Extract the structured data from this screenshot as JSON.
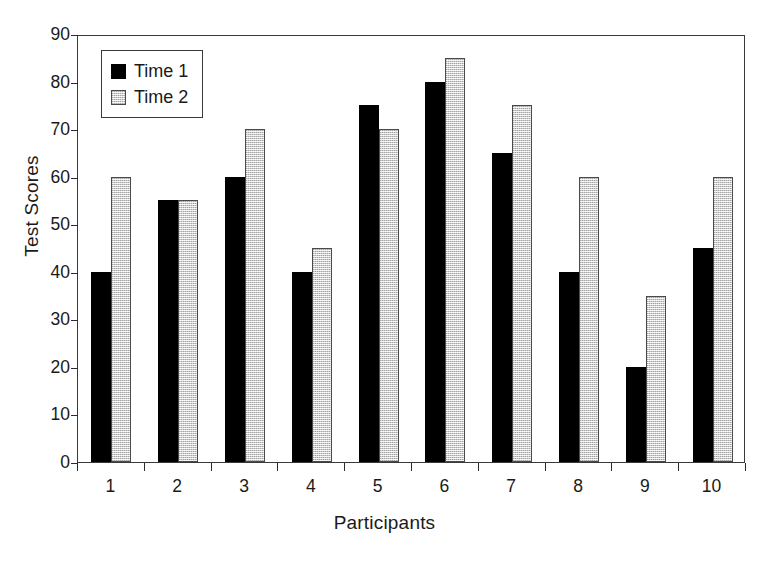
{
  "chart_data": {
    "type": "bar",
    "title": "",
    "xlabel": "Participants",
    "ylabel": "Test Scores",
    "categories": [
      "1",
      "2",
      "3",
      "4",
      "5",
      "6",
      "7",
      "8",
      "9",
      "10"
    ],
    "series": [
      {
        "name": "Time 1",
        "color": "#000000",
        "values": [
          40,
          55,
          60,
          40,
          75,
          80,
          65,
          40,
          20,
          45
        ]
      },
      {
        "name": "Time 2",
        "color": "#cdcdcd",
        "values": [
          60,
          55,
          70,
          45,
          70,
          85,
          75,
          60,
          35,
          60
        ]
      }
    ],
    "ylim": [
      0,
      90
    ],
    "ytick_step": 10,
    "yticks": [
      "0",
      "10",
      "20",
      "30",
      "40",
      "50",
      "60",
      "70",
      "80",
      "90"
    ],
    "grid": false,
    "legend_position": "top-left-inside",
    "frame": true
  }
}
